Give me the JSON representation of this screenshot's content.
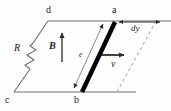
{
  "figure": {
    "type": "physics-diagram",
    "background_color": "#fdfdfd",
    "line_color": "#6e6e6e",
    "bar_color": "#000000",
    "arrow_color": "#2b2b2b",
    "dashed_color": "#9a9a9a"
  },
  "labels": {
    "vertex_d": "d",
    "vertex_a": "a",
    "vertex_c": "c",
    "vertex_b": "b",
    "resistor": "R",
    "field": "B",
    "length": "e",
    "velocity": "v",
    "displacement": "dy"
  },
  "elements": {
    "circuit_loop_name": "parallelogram-circuit-loop",
    "resistor_name": "resistor-zigzag",
    "bar_name": "conducting-bar",
    "field_arrow_name": "magnetic-field-arrow",
    "velocity_arrow_name": "velocity-arrow",
    "length_arrow_name": "length-dimension-arrow",
    "displacement_arrow_name": "displacement-dimension-arrow",
    "dashed_name": "displaced-bar-dashed-line"
  }
}
